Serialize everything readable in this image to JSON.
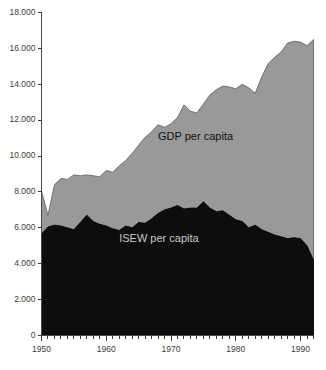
{
  "chart_data": {
    "type": "area",
    "title": "",
    "subtitle": "",
    "xlabel": "",
    "ylabel": "",
    "xlim": [
      1950,
      1992
    ],
    "ylim": [
      0,
      18000
    ],
    "grid": false,
    "legend_position": "inline-annotation",
    "y_ticks": [
      0,
      2000,
      4000,
      6000,
      8000,
      10000,
      12000,
      14000,
      16000,
      18000
    ],
    "y_tick_labels": [
      "0",
      "2.000",
      "4.000",
      "6.000",
      "8.000",
      "10.000",
      "12.000",
      "14.000",
      "16.000",
      "18.000"
    ],
    "x_ticks": [
      1950,
      1960,
      1970,
      1980,
      1990
    ],
    "x_tick_labels": [
      "1950",
      "1960",
      "1970",
      "1980",
      "1990"
    ],
    "x_minor_tick_step": 1,
    "annotations": [
      {
        "text": "GDP per capita",
        "x": 1968,
        "y": 10900
      },
      {
        "text": "ISEW per capita",
        "x": 1962,
        "y": 5200
      }
    ],
    "colors": {
      "gdp_fill": "#999999",
      "isew_fill": "#0d0d0d",
      "axis": "#4a4a4a",
      "background": "#ffffff",
      "gdp_label": "#111111",
      "isew_label": "#c9c9c9"
    },
    "x": [
      1950,
      1951,
      1952,
      1953,
      1954,
      1955,
      1956,
      1957,
      1958,
      1959,
      1960,
      1961,
      1962,
      1963,
      1964,
      1965,
      1966,
      1967,
      1968,
      1969,
      1970,
      1971,
      1972,
      1973,
      1974,
      1975,
      1976,
      1977,
      1978,
      1979,
      1980,
      1981,
      1982,
      1983,
      1984,
      1985,
      1986,
      1987,
      1988,
      1989,
      1990,
      1991,
      1992
    ],
    "series": [
      {
        "name": "GDP per capita",
        "color": "#999999",
        "values": [
          8050,
          6700,
          8400,
          8750,
          8700,
          8950,
          8900,
          8950,
          8900,
          8850,
          9200,
          9100,
          9450,
          9750,
          10150,
          10600,
          11050,
          11350,
          11750,
          11600,
          11800,
          12150,
          12850,
          12500,
          12400,
          12900,
          13400,
          13700,
          13900,
          13850,
          13750,
          14000,
          13800,
          13500,
          14400,
          15150,
          15500,
          15800,
          16300,
          16400,
          16350,
          16150,
          16500
        ]
      },
      {
        "name": "ISEW per capita",
        "color": "#0d0d0d",
        "values": [
          5650,
          6050,
          6150,
          6100,
          6000,
          5900,
          6300,
          6700,
          6350,
          6200,
          6100,
          5950,
          5850,
          6100,
          6000,
          6300,
          6250,
          6500,
          6800,
          7000,
          7100,
          7250,
          7050,
          7100,
          7100,
          7450,
          7100,
          6900,
          6950,
          6700,
          6450,
          6350,
          6000,
          6150,
          5900,
          5750,
          5600,
          5500,
          5400,
          5450,
          5400,
          5000,
          4200
        ]
      }
    ]
  }
}
